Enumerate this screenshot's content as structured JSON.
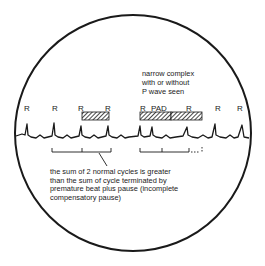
{
  "diagram": {
    "type": "ECG rhythm strip in magnified circle",
    "annotation_top": {
      "lines": [
        "narrow complex",
        "with or without",
        "P wave seen"
      ]
    },
    "r_labels": [
      {
        "text": "R",
        "x": 27
      },
      {
        "text": "R",
        "x": 54
      },
      {
        "text": "R",
        "x": 80
      },
      {
        "text": "R",
        "x": 107
      },
      {
        "text": "R",
        "x": 142
      },
      {
        "text": "PAD",
        "x": 152
      },
      {
        "text": "R",
        "x": 188
      },
      {
        "text": "R",
        "x": 217
      },
      {
        "text": "R",
        "x": 239
      }
    ],
    "hatched_bars": [
      {
        "name": "normal-cycle-bar",
        "x": 82,
        "width": 27
      },
      {
        "name": "premature-cycle-bar",
        "x": 140,
        "width": 31
      },
      {
        "name": "pause-bar",
        "x": 171,
        "width": 31
      }
    ],
    "caption": {
      "lines": [
        "the sum of 2 normal cycles is greater",
        "than the sum of cycle terminated by",
        "premature beat plus pause (incomplete",
        "compensatory pause)"
      ]
    },
    "colors": {
      "ink": "#1a1a1a",
      "background": "#ffffff"
    }
  }
}
